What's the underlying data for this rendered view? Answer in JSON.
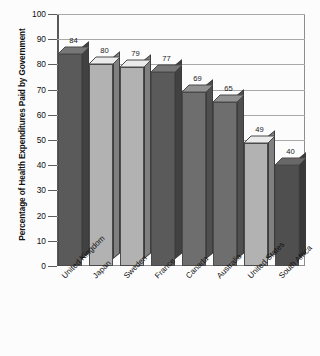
{
  "chart_data": {
    "type": "bar",
    "title": "",
    "xlabel": "",
    "ylabel": "Percentage of Health Expenditures Paid by Government",
    "ylim": [
      0,
      100
    ],
    "yticks": [
      0,
      10,
      20,
      30,
      40,
      50,
      60,
      70,
      80,
      90,
      100
    ],
    "grid": true,
    "legend": "none",
    "categories": [
      "United Kingdom",
      "Japan",
      "Sweden",
      "France",
      "Canada",
      "Australia",
      "United States",
      "South Africa"
    ],
    "values": [
      84,
      80,
      79,
      77,
      69,
      65,
      49,
      40
    ],
    "value_labels": [
      "84",
      "80",
      "79",
      "77",
      "69",
      "65",
      "49",
      "40"
    ],
    "bar_colors": [
      "#5a5a5a",
      "#b2b2b2",
      "#b2b2b2",
      "#5a5a5a",
      "#6e6e6e",
      "#6e6e6e",
      "#b2b2b2",
      "#4f4f4f"
    ],
    "style": "3d-column",
    "background_color": "#fcfcfc",
    "axis_color": "#595959",
    "gridline_color": "#a8a8a8"
  },
  "axis": {
    "y_title": "Percentage of Health Expenditures Paid by Government",
    "tick_labels": [
      "100",
      "90",
      "80",
      "70",
      "60",
      "50",
      "40",
      "30",
      "20",
      "10",
      "0"
    ]
  }
}
